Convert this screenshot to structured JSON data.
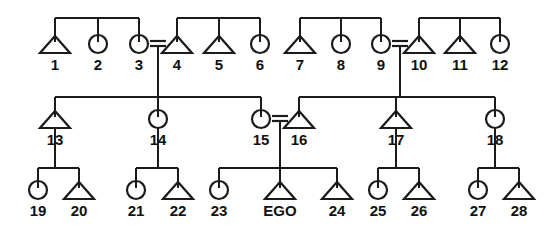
{
  "diagram": {
    "type": "kinship-genealogy-chart",
    "ego_label": "EGO",
    "symbol_legend": {
      "triangle": "male",
      "circle": "female",
      "equals": "marriage",
      "vertical-line": "descent",
      "horizontal-bar": "sibling-set"
    },
    "generations": [
      {
        "id": "generation-1",
        "name": "grandparent-generation",
        "persons": [
          {
            "id": "p1",
            "label": "1",
            "sex": "male",
            "x": 55,
            "y": 53
          },
          {
            "id": "p2",
            "label": "2",
            "sex": "female",
            "x": 98,
            "y": 53
          },
          {
            "id": "p3",
            "label": "3",
            "sex": "female",
            "x": 139,
            "y": 53
          },
          {
            "id": "p4",
            "label": "4",
            "sex": "male",
            "x": 177,
            "y": 53
          },
          {
            "id": "p5",
            "label": "5",
            "sex": "male",
            "x": 219,
            "y": 53
          },
          {
            "id": "p6",
            "label": "6",
            "sex": "female",
            "x": 260,
            "y": 53
          },
          {
            "id": "p7",
            "label": "7",
            "sex": "male",
            "x": 300,
            "y": 53
          },
          {
            "id": "p8",
            "label": "8",
            "sex": "female",
            "x": 341,
            "y": 53
          },
          {
            "id": "p9",
            "label": "9",
            "sex": "female",
            "x": 381,
            "y": 53
          },
          {
            "id": "p10",
            "label": "10",
            "sex": "male",
            "x": 419,
            "y": 53
          },
          {
            "id": "p11",
            "label": "11",
            "sex": "male",
            "x": 460,
            "y": 53
          },
          {
            "id": "p12",
            "label": "12",
            "sex": "female",
            "x": 500,
            "y": 53
          }
        ]
      },
      {
        "id": "generation-2",
        "name": "parent-generation",
        "persons": [
          {
            "id": "p13",
            "label": "13",
            "sex": "male",
            "x": 55,
            "y": 128
          },
          {
            "id": "p14",
            "label": "14",
            "sex": "female",
            "x": 158,
            "y": 128
          },
          {
            "id": "p15",
            "label": "15",
            "sex": "female",
            "x": 261,
            "y": 128
          },
          {
            "id": "p16",
            "label": "16",
            "sex": "male",
            "x": 299,
            "y": 128
          },
          {
            "id": "p17",
            "label": "17",
            "sex": "male",
            "x": 396,
            "y": 128
          },
          {
            "id": "p18",
            "label": "18",
            "sex": "female",
            "x": 495,
            "y": 128
          }
        ]
      },
      {
        "id": "generation-3",
        "name": "ego-generation",
        "persons": [
          {
            "id": "p19",
            "label": "19",
            "sex": "female",
            "x": 38,
            "y": 199
          },
          {
            "id": "p20",
            "label": "20",
            "sex": "male",
            "x": 79,
            "y": 199
          },
          {
            "id": "p21",
            "label": "21",
            "sex": "female",
            "x": 136,
            "y": 199
          },
          {
            "id": "p22",
            "label": "22",
            "sex": "male",
            "x": 178,
            "y": 199
          },
          {
            "id": "p23",
            "label": "23",
            "sex": "female",
            "x": 219,
            "y": 199
          },
          {
            "id": "pE",
            "label": "EGO",
            "sex": "male",
            "x": 280,
            "y": 199,
            "is_ego": true
          },
          {
            "id": "p24",
            "label": "24",
            "sex": "male",
            "x": 337,
            "y": 199
          },
          {
            "id": "p25",
            "label": "25",
            "sex": "female",
            "x": 378,
            "y": 199
          },
          {
            "id": "p26",
            "label": "26",
            "sex": "male",
            "x": 419,
            "y": 199
          },
          {
            "id": "p27",
            "label": "27",
            "sex": "female",
            "x": 478,
            "y": 199
          },
          {
            "id": "p28",
            "label": "28",
            "sex": "male",
            "x": 519,
            "y": 199
          }
        ]
      }
    ],
    "marriages": [
      {
        "id": "m-3-4",
        "left": "p3",
        "right": "p4",
        "x1": 150,
        "x2": 166,
        "y": 44,
        "descent_x": 158,
        "descent_to_y": 97
      },
      {
        "id": "m-9-10",
        "left": "p9",
        "right": "p10",
        "x1": 392,
        "x2": 408,
        "y": 44,
        "descent_x": 400,
        "descent_to_y": 97
      },
      {
        "id": "m-15-16",
        "left": "p15",
        "right": "p16",
        "x1": 272,
        "x2": 288,
        "y": 119,
        "descent_x": 280,
        "descent_to_y": 168
      }
    ],
    "sibling_groups": [
      {
        "id": "sg-1-3",
        "bar_y": 18,
        "x1": 55,
        "x2": 139,
        "drops": [
          55,
          98,
          139
        ],
        "drop_to_y": 42
      },
      {
        "id": "sg-4-6",
        "bar_y": 18,
        "x1": 177,
        "x2": 260,
        "drops": [
          177,
          219,
          260
        ],
        "drop_to_y": 42
      },
      {
        "id": "sg-7-9",
        "bar_y": 18,
        "x1": 300,
        "x2": 381,
        "drops": [
          300,
          341,
          381
        ],
        "drop_to_y": 42
      },
      {
        "id": "sg-10-12",
        "bar_y": 18,
        "x1": 419,
        "x2": 500,
        "drops": [
          419,
          460,
          500
        ],
        "drop_to_y": 42
      },
      {
        "id": "sg-13-15",
        "bar_y": 97,
        "x1": 55,
        "x2": 261,
        "drops": [
          55,
          158,
          261
        ],
        "drop_to_y": 117
      },
      {
        "id": "sg-16-18",
        "bar_y": 97,
        "x1": 299,
        "x2": 495,
        "drops": [
          299,
          396,
          495
        ],
        "drop_to_y": 117
      },
      {
        "id": "sg-19-20",
        "bar_y": 168,
        "x1": 38,
        "x2": 79,
        "drops": [
          38,
          79
        ],
        "drop_to_y": 188
      },
      {
        "id": "sg-21-22",
        "bar_y": 168,
        "x1": 136,
        "x2": 178,
        "drops": [
          136,
          178
        ],
        "drop_to_y": 188
      },
      {
        "id": "sg-23-24",
        "bar_y": 168,
        "x1": 219,
        "x2": 337,
        "drops": [
          219,
          280,
          337
        ],
        "drop_to_y": 188
      },
      {
        "id": "sg-25-26",
        "bar_y": 168,
        "x1": 378,
        "x2": 419,
        "drops": [
          378,
          419
        ],
        "drop_to_y": 188
      },
      {
        "id": "sg-27-28",
        "bar_y": 168,
        "x1": 478,
        "x2": 519,
        "drops": [
          478,
          519
        ],
        "drop_to_y": 188
      }
    ],
    "descent_lines": [
      {
        "id": "d-13-kids",
        "x": 55,
        "y1": 128,
        "y2": 168,
        "from": "p13"
      },
      {
        "id": "d-14-kids",
        "x": 158,
        "y1": 128,
        "y2": 168,
        "from": "p14"
      },
      {
        "id": "d-17-kids",
        "x": 396,
        "y1": 128,
        "y2": 168,
        "from": "p17"
      },
      {
        "id": "d-18-kids",
        "x": 495,
        "y1": 128,
        "y2": 168,
        "from": "p18"
      }
    ],
    "colors": {
      "ink": "#1b1b1b",
      "background": "#ffffff",
      "label": "#111111"
    }
  }
}
